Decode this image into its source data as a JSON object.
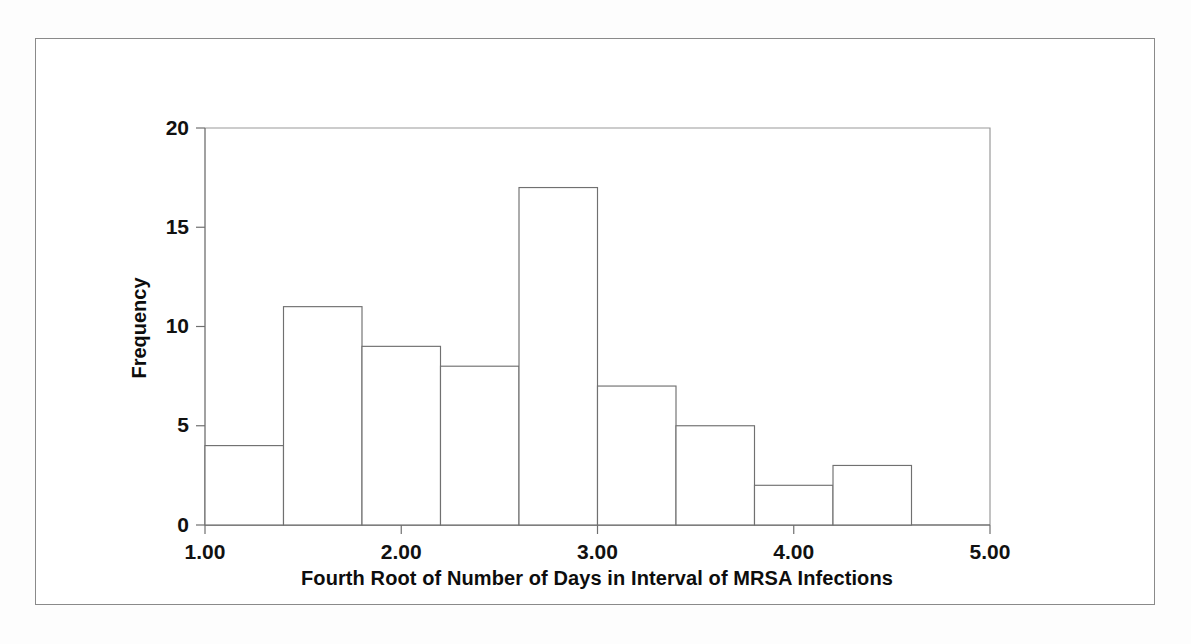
{
  "figure": {
    "background_color": "#ffffff",
    "frame_color": "#8a8a8a",
    "axis_color": "#6f6f6f",
    "bar_stroke_color": "#707070",
    "bar_fill_color": "#ffffff"
  },
  "chart_data": {
    "type": "bar",
    "title": "",
    "xlabel": "Fourth Root of Number of Days in Interval of MRSA Infections",
    "ylabel": "Frequency",
    "xlim": [
      1.0,
      5.0
    ],
    "ylim": [
      0,
      20
    ],
    "grid": false,
    "legend": "none",
    "bin_width": 0.4,
    "x_tick_labels": [
      "1.00",
      "2.00",
      "3.00",
      "4.00",
      "5.00"
    ],
    "x_tick_values": [
      1.0,
      2.0,
      3.0,
      4.0,
      5.0
    ],
    "x_minor_tick_values": [
      1.4,
      1.8,
      2.2,
      2.6,
      3.0,
      3.4,
      3.8,
      4.2,
      4.6
    ],
    "y_tick_labels": [
      "0",
      "5",
      "10",
      "15",
      "20"
    ],
    "y_tick_values": [
      0,
      5,
      10,
      15,
      20
    ],
    "categories": [
      "1.0-1.4",
      "1.4-1.8",
      "1.8-2.2",
      "2.2-2.6",
      "2.6-3.0",
      "3.0-3.4",
      "3.4-3.8",
      "3.8-4.2",
      "4.2-4.6"
    ],
    "bin_edges": [
      1.0,
      1.4,
      1.8,
      2.2,
      2.6,
      3.0,
      3.4,
      3.8,
      4.2,
      4.6
    ],
    "values": [
      4,
      11,
      9,
      8,
      17,
      7,
      5,
      2,
      3
    ],
    "total_count": 66
  }
}
